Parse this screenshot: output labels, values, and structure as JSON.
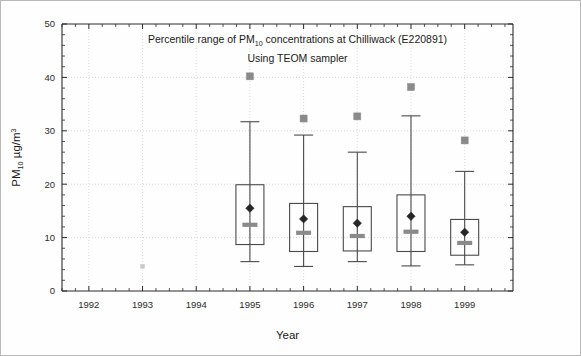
{
  "chart_data": {
    "type": "box",
    "title": "Percentile range of PM10 concentrations at Chilliwack (E220891)",
    "title_parts": {
      "before": "Percentile range of PM",
      "subscript": "10",
      "after": " concentrations at Chilliwack (E220891)"
    },
    "subtitle": "Using TEOM sampler",
    "xlabel": "Year",
    "ylabel": "PM10 µg/m3",
    "ylabel_parts": {
      "before": "PM",
      "subscript": "10",
      "mid": " µg/m",
      "superscript": "3"
    },
    "xlim": [
      1991.5,
      1999.9
    ],
    "ylim": [
      0,
      50
    ],
    "ytick_labels": [
      "0",
      "10",
      "20",
      "30",
      "40",
      "50"
    ],
    "ytick_values": [
      0,
      10,
      20,
      30,
      40,
      50
    ],
    "xtick_labels": [
      "1992",
      "1993",
      "1994",
      "1995",
      "1996",
      "1997",
      "1998",
      "1999"
    ],
    "xtick_values": [
      1992,
      1993,
      1994,
      1995,
      1996,
      1997,
      1998,
      1999
    ],
    "y_minor_interval": 2,
    "grid": "both",
    "legend": "none",
    "categories": [
      1995,
      1996,
      1997,
      1998,
      1999
    ],
    "boxes": [
      {
        "year": 1995,
        "label": "1995",
        "whisker_low": 5.5,
        "box_low": 8.7,
        "median": 12.4,
        "mean": 15.5,
        "box_high": 19.9,
        "whisker_high": 31.7,
        "outlier_high": 40.2
      },
      {
        "year": 1996,
        "label": "1996",
        "whisker_low": 4.6,
        "box_low": 7.4,
        "median": 10.9,
        "mean": 13.5,
        "box_high": 16.4,
        "whisker_high": 29.2,
        "outlier_high": 32.3
      },
      {
        "year": 1997,
        "label": "1997",
        "whisker_low": 5.5,
        "box_low": 7.5,
        "median": 10.3,
        "mean": 12.7,
        "box_high": 15.8,
        "whisker_high": 26.0,
        "outlier_high": 32.7
      },
      {
        "year": 1998,
        "label": "1998",
        "whisker_low": 4.7,
        "box_low": 7.4,
        "median": 11.1,
        "mean": 14.0,
        "box_high": 18.0,
        "whisker_high": 32.8,
        "outlier_high": 38.2
      },
      {
        "year": 1999,
        "label": "1999",
        "whisker_low": 4.9,
        "box_low": 6.7,
        "median": 9.0,
        "mean": 11.0,
        "box_high": 13.4,
        "whisker_high": 22.4,
        "outlier_high": 28.2
      }
    ],
    "stray_marks": [
      {
        "year": 1993,
        "value": 4.6
      }
    ],
    "colors": {
      "axis": "#2b2b2b",
      "grid": "#c9c9c9",
      "box_stroke": "#4a4a4a",
      "median": "#8a8a8a",
      "mean": "#262626",
      "outlier": "#8a8a8a",
      "background": "#ffffff"
    }
  }
}
